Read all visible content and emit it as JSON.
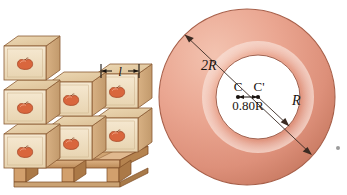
{
  "figure": {
    "background_color": "#ffffff"
  },
  "panels": {
    "boxes": {
      "name": "stacked-boxes-on-pallet",
      "dimension_label": "l",
      "box_count": 7,
      "rows": [
        {
          "name": "bottom-row",
          "count": 3
        },
        {
          "name": "middle-row",
          "count": 3
        },
        {
          "name": "top-row",
          "count": 1
        }
      ],
      "colors": {
        "box_front": "#f0dfc0",
        "box_front_shadow": "#e6d2ad",
        "box_top": "#e4cba3",
        "box_side": "#cfa877",
        "box_edge": "#8a5a32",
        "fruit": "#d9663d",
        "fruit_dark": "#a6421f",
        "pallet_wood": "#d6a875",
        "pallet_wood_dark": "#b07c4a",
        "pallet_edge": "#7d4a23"
      }
    },
    "annulus": {
      "name": "annular-disk",
      "labels": {
        "outer_radius": "2R",
        "inner_radius": "R",
        "center_outer": "C",
        "center_inner": "C'",
        "offset": "0.80R"
      },
      "colors": {
        "ring_light": "#f0b8a4",
        "ring_mid": "#e49b84",
        "ring_dark": "#cf7f66",
        "ring_edge": "#9e5a46",
        "hole": "#ffffff",
        "line": "#3a2a22"
      },
      "geometry": {
        "outer_radius_px": 88,
        "inner_radius_px": 42,
        "center_x_px": 92,
        "center_y_px": 97,
        "inner_center_x_px": 103,
        "inner_center_y_px": 97
      }
    }
  },
  "artifacts": {
    "speck_label": "scan-speck",
    "speck_color": "#8a8a8a"
  }
}
